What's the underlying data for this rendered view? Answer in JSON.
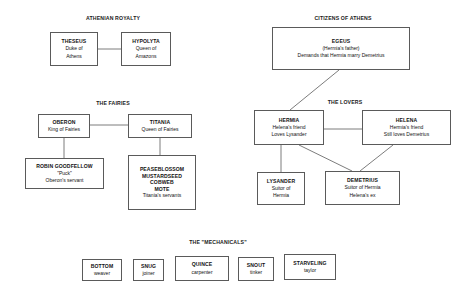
{
  "diagram": {
    "line_color": "#5a5a5a",
    "background": "#ffffff",
    "text_color": "#111111"
  },
  "sections": {
    "royalty": {
      "title": "ATHENIAN ROYALTY"
    },
    "citizens": {
      "title": "CITIZENS OF ATHENS"
    },
    "fairies": {
      "title": "THE FAIRIES"
    },
    "lovers": {
      "title": "THE LOVERS"
    },
    "mechanicals": {
      "title": "THE \"MECHANICALS\""
    }
  },
  "nodes": {
    "theseus": {
      "name": "THESEUS",
      "l1": "Duke of",
      "l2": "Athens"
    },
    "hypolyta": {
      "name": "HYPOLYTA",
      "l1": "Queen of",
      "l2": "Amazons"
    },
    "egeus": {
      "name": "EGEUS",
      "l1": "(Hermia's father)",
      "l2": "Demands that Hermia marry Demetrius"
    },
    "oberon": {
      "name": "OBERON",
      "l1": "King of Fairies"
    },
    "titania": {
      "name": "TITANIA",
      "l1": "Queen of Fairies"
    },
    "robin": {
      "name": "ROBIN GOODFELLOW",
      "l1": "\"Puck\"",
      "l2": "Oberon's servant"
    },
    "servants": {
      "n1": "PEASEBLOSSOM",
      "n2": "MUSTARDSEED",
      "n3": "COBWEB",
      "n4": "MOTE",
      "l1": "Titania's servants"
    },
    "hermia": {
      "name": "HERMIA",
      "l1": "Helena's friend",
      "l2": "Loves Lysander"
    },
    "helena": {
      "name": "HELENA",
      "l1": "Hermia's friend",
      "l2": "Still loves Demetrius"
    },
    "lysander": {
      "name": "LYSANDER",
      "l1": "Suitor of",
      "l2": "Hermia"
    },
    "demetrius": {
      "name": "DEMETRIUS",
      "l1": "Suitor of Hermia",
      "l2": "Helena's ex"
    },
    "bottom": {
      "name": "BOTTOM",
      "l1": "weaver"
    },
    "snug": {
      "name": "SNUG",
      "l1": "joiner"
    },
    "quince": {
      "name": "QUINCE",
      "l1": "carpenter"
    },
    "snout": {
      "name": "SNOUT",
      "l1": "tinker"
    },
    "starveling": {
      "name": "STARVELING",
      "l1": "taylor"
    }
  }
}
